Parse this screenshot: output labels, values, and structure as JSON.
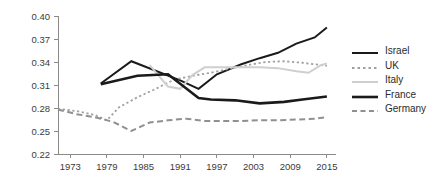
{
  "chart_data": {
    "type": "line",
    "title": "",
    "xlabel": "",
    "ylabel": "",
    "xlim": [
      1971,
      2016
    ],
    "ylim": [
      0.22,
      0.4
    ],
    "grid": false,
    "legend_position": "right",
    "x_ticks": [
      1973,
      1979,
      1985,
      1991,
      1997,
      2003,
      2009,
      2015
    ],
    "x_tick_labels": [
      "1973",
      "1979",
      "1985",
      "1991",
      "1997",
      "2003",
      "2009",
      "2015"
    ],
    "y_ticks": [
      0.22,
      0.25,
      0.28,
      0.31,
      0.34,
      0.37,
      0.4
    ],
    "y_tick_labels": [
      "0.22",
      "0.25",
      "0.28",
      "0.31",
      "0.34",
      "0.37",
      "0.40"
    ],
    "series": [
      {
        "name": "Israel",
        "color": "#1a1a1a",
        "style": "solid",
        "width": 2.0,
        "x": [
          1978,
          1983,
          1991,
          1994,
          1997,
          2001,
          2004,
          2007,
          2010,
          2013,
          2015
        ],
        "values": [
          0.312,
          0.341,
          0.316,
          0.305,
          0.324,
          0.337,
          0.345,
          0.352,
          0.364,
          0.372,
          0.385
        ]
      },
      {
        "name": "UK",
        "color": "#a0a0a0",
        "style": "dotted",
        "width": 1.8,
        "x": [
          1971,
          1974,
          1977,
          1979,
          1981,
          1984,
          1987,
          1990,
          1993,
          1996,
          1999,
          2002,
          2005,
          2008,
          2011,
          2013,
          2015
        ],
        "values": [
          0.279,
          0.276,
          0.271,
          0.264,
          0.281,
          0.294,
          0.305,
          0.317,
          0.322,
          0.326,
          0.331,
          0.336,
          0.34,
          0.341,
          0.339,
          0.337,
          0.335
        ]
      },
      {
        "name": "Italy",
        "color": "#cfcfcf",
        "style": "solid",
        "width": 2.0,
        "x": [
          1986,
          1989,
          1991,
          1993,
          1995,
          1998,
          2001,
          2004,
          2007,
          2010,
          2012,
          2014,
          2015
        ],
        "values": [
          0.336,
          0.308,
          0.305,
          0.323,
          0.333,
          0.333,
          0.333,
          0.333,
          0.332,
          0.328,
          0.326,
          0.336,
          0.338
        ]
      },
      {
        "name": "France",
        "color": "#1a1a1a",
        "style": "solid",
        "width": 2.6,
        "x": [
          1978,
          1984,
          1989,
          1994,
          1996,
          2000,
          2004,
          2008,
          2011,
          2015
        ],
        "values": [
          0.311,
          0.322,
          0.324,
          0.293,
          0.291,
          0.29,
          0.286,
          0.288,
          0.291,
          0.295
        ]
      },
      {
        "name": "Germany",
        "color": "#909090",
        "style": "dashed",
        "width": 2.0,
        "x": [
          1971,
          1974,
          1977,
          1980,
          1983,
          1986,
          1989,
          1992,
          1995,
          1998,
          2001,
          2004,
          2007,
          2010,
          2013,
          2015
        ],
        "values": [
          0.278,
          0.272,
          0.268,
          0.262,
          0.25,
          0.261,
          0.264,
          0.266,
          0.263,
          0.263,
          0.263,
          0.264,
          0.264,
          0.265,
          0.266,
          0.268
        ]
      }
    ]
  },
  "legend": {
    "items": [
      {
        "label": "Israel",
        "swatch": "legend-line-solid-dark-thin"
      },
      {
        "label": "UK",
        "swatch": "legend-line-dotted-gray"
      },
      {
        "label": "Italy",
        "swatch": "legend-line-solid-lightgray"
      },
      {
        "label": "France",
        "swatch": "legend-line-solid-dark-thick"
      },
      {
        "label": "Germany",
        "swatch": "legend-line-dashed-gray"
      }
    ]
  }
}
